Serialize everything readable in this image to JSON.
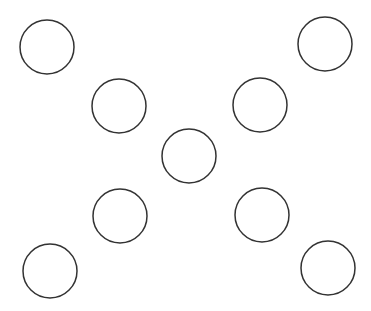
{
  "diagram": {
    "width": 371,
    "height": 311,
    "stroke_color": "#333333",
    "fill_color": "#ffffff",
    "stroke_width": 1.5,
    "circles": [
      {
        "cx": 47,
        "cy": 47,
        "r": 27
      },
      {
        "cx": 119,
        "cy": 106,
        "r": 27
      },
      {
        "cx": 325,
        "cy": 44,
        "r": 27
      },
      {
        "cx": 260,
        "cy": 105,
        "r": 27
      },
      {
        "cx": 189,
        "cy": 156,
        "r": 27
      },
      {
        "cx": 120,
        "cy": 216,
        "r": 27
      },
      {
        "cx": 262,
        "cy": 215,
        "r": 27
      },
      {
        "cx": 50,
        "cy": 271,
        "r": 27
      },
      {
        "cx": 328,
        "cy": 268,
        "r": 27
      }
    ]
  }
}
